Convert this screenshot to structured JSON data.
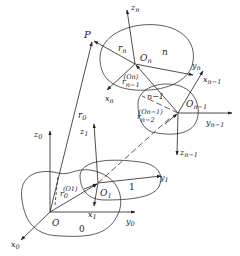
{
  "diagram": {
    "type": "multibody-coordinate-frames",
    "point": {
      "label": "P"
    },
    "vectors": {
      "r0": {
        "base": "r",
        "sub": "0"
      },
      "rn": {
        "base": "r",
        "sub": "n"
      },
      "r0_O1": {
        "base": "r",
        "sub": "0",
        "sup": "(O1)"
      },
      "rn1_On": {
        "base": "r",
        "sub": "n−1",
        "sup": "(On)"
      },
      "rn2_On1": {
        "base": "r",
        "sub": "n−2",
        "sup": "(On−1)"
      }
    },
    "bodies": [
      {
        "id": "0",
        "label": "0",
        "origin": "O",
        "axes": {
          "x": {
            "base": "x",
            "sub": "0"
          },
          "y": {
            "base": "y",
            "sub": "0"
          },
          "z": {
            "base": "z",
            "sub": "0"
          }
        }
      },
      {
        "id": "1",
        "label": "1",
        "origin": {
          "base": "O",
          "sub": "1"
        },
        "axes": {
          "x": {
            "base": "x",
            "sub": "1"
          },
          "y": {
            "base": "y",
            "sub": "1"
          },
          "z": {
            "base": "z",
            "sub": "1"
          }
        }
      },
      {
        "id": "n-1",
        "label": "n−1",
        "origin": {
          "base": "O",
          "sub": "n−1"
        },
        "axes": {
          "x": {
            "base": "x",
            "sub": "n−1"
          },
          "y": {
            "base": "y",
            "sub": "n−1"
          },
          "z": {
            "base": "z",
            "sub": "n−1"
          }
        }
      },
      {
        "id": "n",
        "label": "n",
        "origin": {
          "base": "O",
          "sub": "n"
        },
        "axes": {
          "x": {
            "base": "x",
            "sub": "n"
          },
          "y": {
            "base": "y",
            "sub": "n"
          },
          "z": {
            "base": "z",
            "sub": "n"
          }
        }
      }
    ]
  }
}
